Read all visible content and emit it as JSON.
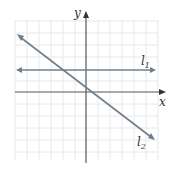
{
  "diagram": {
    "type": "coordinate-plane",
    "axes": {
      "x_label": "x",
      "y_label": "y"
    },
    "lines": [
      {
        "name": "l1",
        "label": "l",
        "subscript": "1",
        "description": "horizontal line above x-axis"
      },
      {
        "name": "l2",
        "label": "l",
        "subscript": "2",
        "description": "line with negative slope"
      }
    ],
    "grid": true,
    "colors": {
      "grid": "#e6e6e6",
      "axis": "#555555",
      "line": "#6f7f8c"
    }
  }
}
